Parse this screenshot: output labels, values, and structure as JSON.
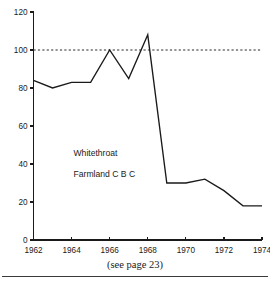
{
  "caption": "(see page 23)",
  "annotations": {
    "species": "Whitethroat",
    "habitat": "Farmland C B C"
  },
  "chart_data": {
    "type": "line",
    "title": "",
    "xlabel": "",
    "ylabel": "",
    "x": [
      1962,
      1963,
      1964,
      1965,
      1966,
      1967,
      1968,
      1969,
      1970,
      1971,
      1972,
      1973,
      1974
    ],
    "values": [
      84,
      80,
      83,
      83,
      100,
      85,
      108,
      30,
      30,
      32,
      26,
      18,
      18
    ],
    "series": [
      {
        "name": "Whitethroat Farmland C B C",
        "values": [
          84,
          80,
          83,
          83,
          100,
          85,
          108,
          30,
          30,
          32,
          26,
          18,
          18
        ]
      }
    ],
    "xlim": [
      1962,
      1974
    ],
    "ylim": [
      0,
      120
    ],
    "xticks": [
      1962,
      1964,
      1966,
      1968,
      1970,
      1972,
      1974
    ],
    "xtick_labels": [
      "1962",
      "1964",
      "1966",
      "1968",
      "1970",
      "1972",
      "1974"
    ],
    "yticks": [
      0,
      20,
      40,
      60,
      80,
      100,
      120
    ],
    "ytick_labels": [
      "0",
      "20",
      "40",
      "60",
      "80",
      "100",
      "120"
    ],
    "grid": false,
    "legend": "none",
    "reference_lines": [
      {
        "name": "baseline-100",
        "value": 100,
        "style": "dashed"
      }
    ],
    "annotations": [
      {
        "text": "Whitethroat",
        "x": 1964.1,
        "y": 44
      },
      {
        "text": "Farmland C B C",
        "x": 1964.1,
        "y": 33
      }
    ],
    "line_color": "#1a1a1a",
    "reference_color": "#2b2b2b",
    "background_color": "#ffffff"
  }
}
